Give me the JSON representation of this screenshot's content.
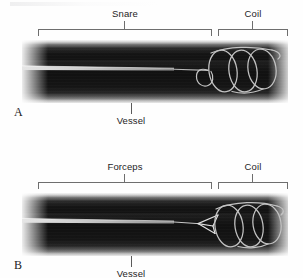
{
  "figure": {
    "type": "radiographic-figure",
    "panel_count": 2,
    "background_color": "#fefefe"
  },
  "panels": [
    {
      "letter": "A",
      "brackets": [
        {
          "label": "Snare",
          "start_px": 38,
          "end_px": 212
        },
        {
          "label": "Coil",
          "start_px": 218,
          "end_px": 288
        }
      ],
      "callouts": [
        {
          "label": "Vessel"
        }
      ],
      "device": {
        "name": "snare",
        "description": "catheter with loop snare encircling coil end",
        "stroke_color": "#b8b8b8"
      },
      "coil": {
        "name": "embolization-coil",
        "loops": 3,
        "stroke_color": "#c2c2c2"
      }
    },
    {
      "letter": "B",
      "brackets": [
        {
          "label": "Forceps",
          "start_px": 38,
          "end_px": 212
        },
        {
          "label": "Coil",
          "start_px": 218,
          "end_px": 288
        }
      ],
      "callouts": [
        {
          "label": "Vessel"
        }
      ],
      "device": {
        "name": "forceps",
        "description": "catheter with open grasping forceps jaws on coil end",
        "stroke_color": "#d2d2d2"
      },
      "coil": {
        "name": "embolization-coil",
        "loops": 3,
        "stroke_color": "#c2c2c2"
      }
    }
  ],
  "colors": {
    "vessel_dark": "#101010",
    "vessel_wall": "#d8d8d8",
    "annotation": "#1d1d1d",
    "bracket": "#6e6e6e",
    "leader": "#5a5a5a"
  }
}
